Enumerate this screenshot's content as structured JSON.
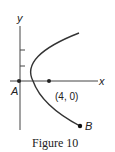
{
  "figure": {
    "caption": "Figure 10",
    "axes": {
      "x_label": "x",
      "y_label": "y"
    },
    "points": [
      {
        "name": "A",
        "label": "A"
      },
      {
        "name": "focus",
        "label": "(4, 0)"
      },
      {
        "name": "B",
        "label": "B"
      }
    ],
    "curve": "parabola opening right"
  },
  "colors": {
    "line": "#333333",
    "background": "#ffffff"
  }
}
